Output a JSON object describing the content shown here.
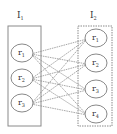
{
  "diagram": {
    "groups": [
      {
        "id": "I1",
        "label": "I",
        "subscript": "1",
        "nodes": [
          {
            "id": "I1-r1",
            "label": "r",
            "subscript": "1"
          },
          {
            "id": "I1-r2",
            "label": "r",
            "subscript": "2"
          },
          {
            "id": "I1-r3",
            "label": "r",
            "subscript": "3"
          }
        ]
      },
      {
        "id": "I2",
        "label": "I",
        "subscript": "2",
        "nodes": [
          {
            "id": "I2-r1",
            "label": "r",
            "subscript": "1"
          },
          {
            "id": "I2-r2",
            "label": "r",
            "subscript": "2"
          },
          {
            "id": "I2-r3",
            "label": "r",
            "subscript": "3"
          },
          {
            "id": "I2-r4",
            "label": "r",
            "subscript": "4"
          }
        ]
      }
    ],
    "edges": "complete-bipartite",
    "edge_style": "dashed",
    "colors": {
      "stroke": "#7a7a7a",
      "text": "#333333",
      "background": "#ffffff"
    }
  }
}
